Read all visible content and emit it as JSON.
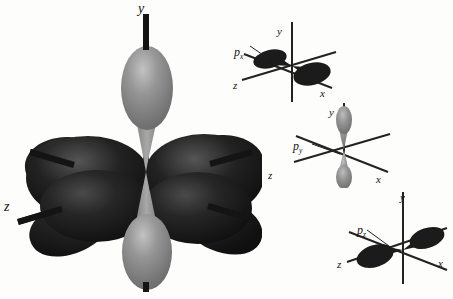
{
  "figure": {
    "background_color": "#fdfdfc",
    "lobe_dark_color": "#1d1d1d",
    "lobe_gray_color": "#8c8c8c",
    "axis_color": "#141414"
  },
  "main_diagram": {
    "name": "combined-p-orbitals",
    "axes": {
      "y": "y",
      "z": "z",
      "x": "x"
    }
  },
  "panels": [
    {
      "id": "px",
      "orbital_label": "p",
      "orbital_subscript": "x",
      "lobe_color": "#1d1d1d",
      "axes": {
        "y": "y",
        "z": "z",
        "x": "x"
      }
    },
    {
      "id": "py",
      "orbital_label": "p",
      "orbital_subscript": "y",
      "lobe_color": "#8c8c8c",
      "axes": {
        "y": "y",
        "z": "z",
        "x": "x"
      }
    },
    {
      "id": "pz",
      "orbital_label": "p",
      "orbital_subscript": "z",
      "lobe_color": "#1d1d1d",
      "axes": {
        "y": "y",
        "z": "z",
        "x": "x"
      }
    }
  ]
}
